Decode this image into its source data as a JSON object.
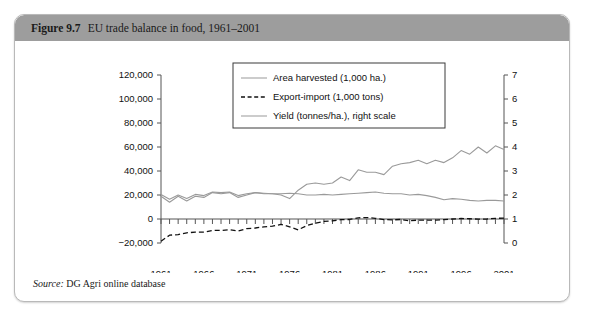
{
  "figure": {
    "number": "Figure 9.7",
    "title": "EU trade balance in food, 1961–2001",
    "source_label": "Source:",
    "source_text": "DG Agri online database"
  },
  "chart_data": {
    "type": "line",
    "title": "EU trade balance in food, 1961–2001",
    "xlabel": "",
    "ylabel": "",
    "grid": false,
    "legend_position": "top-center",
    "xlim": [
      1961,
      2001
    ],
    "xticks": [
      1961,
      1966,
      1971,
      1976,
      1981,
      1986,
      1991,
      1996,
      2001
    ],
    "xtick_labels": [
      "1961",
      "1966",
      "1971",
      "1976",
      "1981",
      "1986",
      "1991",
      "1996",
      "2001"
    ],
    "left_axis": {
      "ylim": [
        -20000,
        120000
      ],
      "yticks": [
        -20000,
        0,
        20000,
        40000,
        60000,
        80000,
        100000,
        120000
      ],
      "ytick_labels": [
        "−20,000",
        "0",
        "20,000",
        "40,000",
        "60,000",
        "80,000",
        "100,000",
        "120,000"
      ]
    },
    "right_axis": {
      "ylim": [
        0,
        7
      ],
      "yticks": [
        0,
        1,
        2,
        3,
        4,
        5,
        6,
        7
      ],
      "ytick_labels": [
        "0",
        "1",
        "2",
        "3",
        "4",
        "5",
        "6",
        "7"
      ],
      "label": "right scale"
    },
    "x": [
      1961,
      1962,
      1963,
      1964,
      1965,
      1966,
      1967,
      1968,
      1969,
      1970,
      1971,
      1972,
      1973,
      1974,
      1975,
      1976,
      1977,
      1978,
      1979,
      1980,
      1981,
      1982,
      1983,
      1984,
      1985,
      1986,
      1987,
      1988,
      1989,
      1990,
      1991,
      1992,
      1993,
      1994,
      1995,
      1996,
      1997,
      1998,
      1999,
      2000,
      2001
    ],
    "series": [
      {
        "name": "Area harvested (1,000 ha.)",
        "axis": "left",
        "style": "solid",
        "color": "#9a9a9a",
        "values": [
          20500,
          16500,
          20000,
          17000,
          20500,
          19500,
          22500,
          22000,
          22500,
          19500,
          21000,
          22000,
          21500,
          21000,
          21000,
          21500,
          21000,
          20000,
          20000,
          20500,
          20000,
          20500,
          21000,
          21500,
          22000,
          22500,
          21500,
          21000,
          21000,
          20000,
          20500,
          19500,
          18000,
          16000,
          17000,
          16500,
          15500,
          15000,
          15500,
          15500,
          15000
        ]
      },
      {
        "name": "Export-import (1,000 tons)",
        "axis": "left",
        "style": "dashed",
        "color": "#111111",
        "values": [
          -18500,
          -13500,
          -13000,
          -11500,
          -11000,
          -11000,
          -9500,
          -9500,
          -9000,
          -10000,
          -8000,
          -7500,
          -6500,
          -6000,
          -4500,
          -6500,
          -9000,
          -5500,
          -3500,
          -2000,
          -1500,
          -500,
          -400,
          1000,
          1200,
          600,
          -500,
          -700,
          -400,
          -1500,
          -900,
          -1000,
          -900,
          -500,
          0,
          400,
          200,
          -100,
          0,
          500,
          800
        ]
      },
      {
        "name": "Yield (tonnes/ha.), right scale",
        "axis": "right",
        "style": "solid",
        "color": "#9a9a9a",
        "values": [
          1.95,
          1.7,
          1.95,
          1.75,
          1.95,
          1.9,
          2.1,
          2.05,
          2.1,
          1.9,
          2.0,
          2.1,
          2.05,
          2.05,
          2.0,
          1.85,
          2.2,
          2.45,
          2.5,
          2.45,
          2.5,
          2.75,
          2.6,
          3.05,
          2.95,
          2.95,
          2.85,
          3.2,
          3.3,
          3.35,
          3.45,
          3.3,
          3.45,
          3.35,
          3.55,
          3.85,
          3.7,
          4.0,
          3.75,
          4.05,
          3.9
        ]
      }
    ],
    "legend": [
      {
        "label": "Area harvested (1,000 ha.)",
        "style": "solid",
        "color": "#9a9a9a"
      },
      {
        "label": "Export-import (1,000 tons)",
        "style": "dashed",
        "color": "#111111"
      },
      {
        "label": "Yield (tonnes/ha.), right scale",
        "style": "solid",
        "color": "#9a9a9a"
      }
    ]
  },
  "colors": {
    "title_bar": "#9d9d9d",
    "frame": "#b9b9b9",
    "series_gray": "#9a9a9a",
    "series_black": "#111111"
  }
}
